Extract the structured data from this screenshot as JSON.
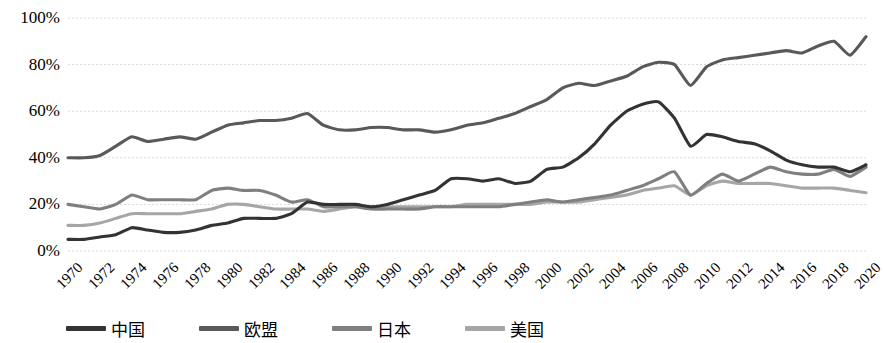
{
  "chart_data": {
    "type": "line",
    "title": "",
    "subtitle": "",
    "xlabel": "",
    "ylabel": "",
    "ylim": [
      0,
      100
    ],
    "xlim": [
      1970,
      2020
    ],
    "grid": true,
    "grid_axis": "y",
    "grid_style": "dotted",
    "legend_position": "bottom",
    "y_ticks": [
      "0%",
      "20%",
      "40%",
      "60%",
      "80%",
      "100%"
    ],
    "y_tick_values": [
      0,
      20,
      40,
      60,
      80,
      100
    ],
    "x_ticks": [
      "1970",
      "1972",
      "1974",
      "1976",
      "1978",
      "1980",
      "1982",
      "1984",
      "1986",
      "1988",
      "1990",
      "1992",
      "1994",
      "1996",
      "1998",
      "2000",
      "2002",
      "2004",
      "2006",
      "2008",
      "2010",
      "2012",
      "2014",
      "2016",
      "2018",
      "2020"
    ],
    "x_values": [
      1970,
      1971,
      1972,
      1973,
      1974,
      1975,
      1976,
      1977,
      1978,
      1979,
      1980,
      1981,
      1982,
      1983,
      1984,
      1985,
      1986,
      1987,
      1988,
      1989,
      1990,
      1991,
      1992,
      1993,
      1994,
      1995,
      1996,
      1997,
      1998,
      1999,
      2000,
      2001,
      2002,
      2003,
      2004,
      2005,
      2006,
      2007,
      2008,
      2009,
      2010,
      2011,
      2012,
      2013,
      2014,
      2015,
      2016,
      2017,
      2018,
      2019,
      2020
    ],
    "series": [
      {
        "name": "中国",
        "color": "#333333",
        "values": [
          5,
          5,
          6,
          7,
          10,
          9,
          8,
          8,
          9,
          11,
          12,
          14,
          14,
          14,
          16,
          21,
          20,
          20,
          20,
          19,
          20,
          22,
          24,
          26,
          31,
          31,
          30,
          31,
          29,
          30,
          35,
          36,
          40,
          46,
          54,
          60,
          63,
          64,
          57,
          45,
          50,
          49,
          47,
          46,
          43,
          39,
          37,
          36,
          36,
          34,
          37
        ]
      },
      {
        "name": "欧盟",
        "color": "#595959",
        "values": [
          40,
          40,
          41,
          45,
          49,
          47,
          48,
          49,
          48,
          51,
          54,
          55,
          56,
          56,
          57,
          59,
          54,
          52,
          52,
          53,
          53,
          52,
          52,
          51,
          52,
          54,
          55,
          57,
          59,
          62,
          65,
          70,
          72,
          71,
          73,
          75,
          79,
          81,
          80,
          71,
          79,
          82,
          83,
          84,
          85,
          86,
          85,
          88,
          90,
          84,
          92
        ]
      },
      {
        "name": "日本",
        "color": "#7f7f7f",
        "values": [
          20,
          19,
          18,
          20,
          24,
          22,
          22,
          22,
          22,
          26,
          27,
          26,
          26,
          24,
          21,
          22,
          19,
          19,
          19,
          18,
          18,
          18,
          18,
          19,
          19,
          19,
          19,
          19,
          20,
          21,
          22,
          21,
          22,
          23,
          24,
          26,
          28,
          31,
          34,
          24,
          29,
          33,
          30,
          33,
          36,
          34,
          33,
          33,
          35,
          32,
          36
        ]
      },
      {
        "name": "美国",
        "color": "#a6a6a6",
        "values": [
          11,
          11,
          12,
          14,
          16,
          16,
          16,
          16,
          17,
          18,
          20,
          20,
          19,
          18,
          18,
          18,
          17,
          18,
          19,
          19,
          19,
          19,
          19,
          19,
          19,
          20,
          20,
          20,
          20,
          20,
          21,
          21,
          21,
          22,
          23,
          24,
          26,
          27,
          28,
          24,
          28,
          30,
          29,
          29,
          29,
          28,
          27,
          27,
          27,
          26,
          25
        ]
      }
    ]
  },
  "legend": {
    "items": [
      {
        "label": "中国",
        "color": "#333333"
      },
      {
        "label": "欧盟",
        "color": "#595959"
      },
      {
        "label": "日本",
        "color": "#7f7f7f"
      },
      {
        "label": "美国",
        "color": "#a6a6a6"
      }
    ]
  },
  "style": {
    "grid_color": "#d9d9d9",
    "background": "#ffffff",
    "text_color": "#000000"
  }
}
